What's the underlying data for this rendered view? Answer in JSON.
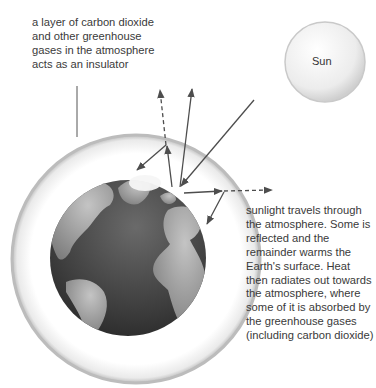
{
  "labels": {
    "insulator_note": "a layer of carbon dioxide and other greenhouse gases in the atmosphere acts as an insulator",
    "sun": "Sun",
    "sunlight_note": "sunlight travels through the atmosphere. Some is reflected and the remainder warms the Earth's surface. Heat then radiates out towards the atmosphere, where some of it is absorbed by the greenhouse gases (including carbon dioxide)"
  },
  "colors": {
    "atmosphere_ring": "#c8c8c8",
    "earth_ocean": "#4a4a4a",
    "earth_land": "#9a9a9a",
    "arrow": "#4d4d4d",
    "sun": "#eeeeee"
  }
}
